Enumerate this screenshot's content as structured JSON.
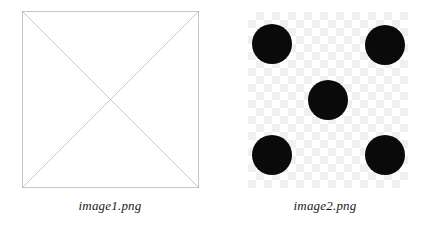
{
  "page": {
    "background_color": "#ffffff",
    "width": 430,
    "height": 230
  },
  "figures": [
    {
      "id": "image1",
      "caption": "image1.png",
      "kind": "placeholder-box-with-x",
      "alt_text": "image1.png",
      "frame": {
        "x": 22,
        "y": 11,
        "width": 177,
        "height": 177
      },
      "stroke_color": "#b0b0b0",
      "fill_color": "#ffffff",
      "stroke_width": 0.7,
      "diagonals": 2
    },
    {
      "id": "image2",
      "caption": "image2.png",
      "kind": "checkerboard-with-dots",
      "alt_text": "image2.png",
      "frame": {
        "x": 248,
        "y": 12,
        "width": 160,
        "height": 176
      },
      "checker_light_color": "#ffffff",
      "checker_dark_color": "#f0f0f0",
      "checker_square_size": 8,
      "dot_color": "#0a0a0a",
      "dot_radius": 20,
      "dot_pattern": "dice-five",
      "dot_count": 5,
      "dots": [
        {
          "name": "top-left",
          "cx": 24,
          "cy": 32
        },
        {
          "name": "top-right",
          "cx": 137,
          "cy": 33
        },
        {
          "name": "center",
          "cx": 80,
          "cy": 88
        },
        {
          "name": "bottom-left",
          "cx": 24,
          "cy": 143
        },
        {
          "name": "bottom-right",
          "cx": 137,
          "cy": 143
        }
      ]
    }
  ]
}
